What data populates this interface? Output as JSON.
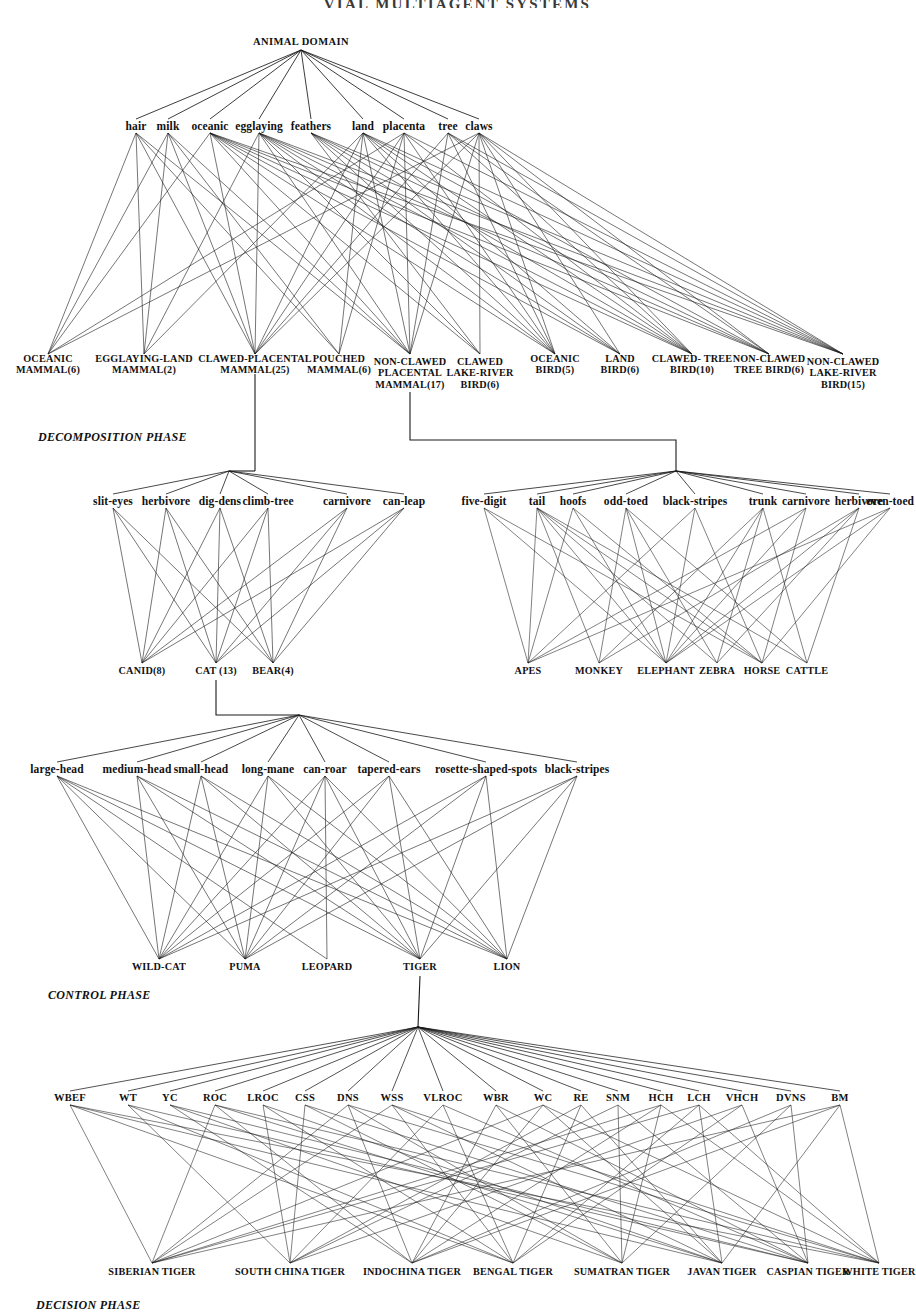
{
  "header": {
    "title": "VIAL MULTIAGENT SYSTEMS"
  },
  "phases": [
    {
      "id": "decomposition",
      "label": "DECOMPOSITION PHASE",
      "x": 38,
      "y": 430
    },
    {
      "id": "control",
      "label": "CONTROL PHASE",
      "x": 48,
      "y": 988
    },
    {
      "id": "decision",
      "label": "DECISION PHASE",
      "x": 36,
      "y": 1298
    }
  ],
  "root": {
    "label": "ANIMAL DOMAIN",
    "x": 301,
    "y": 42
  },
  "layers": {
    "domain_features": {
      "name": "domain-feature-layer",
      "y": 126,
      "items": [
        {
          "label": "hair",
          "x": 136
        },
        {
          "label": "milk",
          "x": 168
        },
        {
          "label": "oceanic",
          "x": 210
        },
        {
          "label": "egglaying",
          "x": 259
        },
        {
          "label": "feathers",
          "x": 311
        },
        {
          "label": "land",
          "x": 363
        },
        {
          "label": "placenta",
          "x": 404
        },
        {
          "label": "tree",
          "x": 448
        },
        {
          "label": "claws",
          "x": 479
        }
      ]
    },
    "decomposition_classes": {
      "name": "decomposition-class-layer",
      "y": 364,
      "items": [
        {
          "lines": [
            "OCEANIC",
            "MAMMAL(6)"
          ],
          "x": 48
        },
        {
          "lines": [
            "EGGLAYING-LAND",
            "MAMMAL(2)"
          ],
          "x": 144
        },
        {
          "lines": [
            "CLAWED-PLACENTAL",
            "MAMMAL(25)"
          ],
          "x": 255
        },
        {
          "lines": [
            "POUCHED",
            "MAMMAL(6)"
          ],
          "x": 339
        },
        {
          "lines": [
            "NON-CLAWED",
            "PLACENTAL",
            "MAMMAL(17)"
          ],
          "x": 410
        },
        {
          "lines": [
            "CLAWED",
            "LAKE-RIVER",
            "BIRD(6)"
          ],
          "x": 480
        },
        {
          "lines": [
            "OCEANIC",
            "BIRD(5)"
          ],
          "x": 555
        },
        {
          "lines": [
            "LAND",
            "BIRD(6)"
          ],
          "x": 620
        },
        {
          "lines": [
            "CLAWED- TREE",
            "BIRD(10)"
          ],
          "x": 692
        },
        {
          "lines": [
            "NON-CLAWED",
            "TREE BIRD(6)"
          ],
          "x": 769
        },
        {
          "lines": [
            "NON-CLAWED",
            "LAKE-RIVER",
            "BIRD(15)"
          ],
          "x": 843
        }
      ]
    },
    "carnivore_features": {
      "name": "clawed-placental-feature-layer",
      "y": 501,
      "items": [
        {
          "label": "slit-eyes",
          "x": 113
        },
        {
          "label": "herbivore",
          "x": 166
        },
        {
          "label": "dig-dens",
          "x": 220
        },
        {
          "label": "climb-tree",
          "x": 268
        },
        {
          "label": "carnivore",
          "x": 347
        },
        {
          "label": "can-leap",
          "x": 404
        }
      ]
    },
    "carnivore_classes": {
      "name": "clawed-placental-class-layer",
      "y": 671,
      "items": [
        {
          "label": "CANID(8)",
          "x": 142
        },
        {
          "label": "CAT  (13)",
          "x": 216
        },
        {
          "label": "BEAR(4)",
          "x": 273
        }
      ]
    },
    "ungulate_features": {
      "name": "non-clawed-placental-feature-layer",
      "y": 501,
      "items": [
        {
          "label": "five-digit",
          "x": 484
        },
        {
          "label": "tail",
          "x": 537
        },
        {
          "label": "hoofs",
          "x": 573
        },
        {
          "label": "odd-toed",
          "x": 626
        },
        {
          "label": "black-stripes",
          "x": 695
        },
        {
          "label": "trunk",
          "x": 763
        },
        {
          "label": "carnivore",
          "x": 806
        },
        {
          "label": "herbivore",
          "x": 859
        },
        {
          "label": "even-toed",
          "x": 890
        }
      ]
    },
    "ungulate_classes": {
      "name": "non-clawed-placental-class-layer",
      "y": 671,
      "items": [
        {
          "label": "APES",
          "x": 528
        },
        {
          "label": "MONKEY",
          "x": 599
        },
        {
          "label": "ELEPHANT",
          "x": 666
        },
        {
          "label": "ZEBRA",
          "x": 717
        },
        {
          "label": "HORSE",
          "x": 762
        },
        {
          "label": "CATTLE",
          "x": 807
        }
      ]
    },
    "cat_features": {
      "name": "cat-feature-layer",
      "y": 769,
      "items": [
        {
          "label": "large-head",
          "x": 57
        },
        {
          "label": "medium-head",
          "x": 137
        },
        {
          "label": "small-head",
          "x": 201
        },
        {
          "label": "long-mane",
          "x": 268
        },
        {
          "label": "can-roar",
          "x": 325
        },
        {
          "label": "tapered-ears",
          "x": 389
        },
        {
          "label": "rosette-shaped-spots",
          "x": 486
        },
        {
          "label": "black-stripes",
          "x": 577
        }
      ]
    },
    "cat_classes": {
      "name": "cat-class-layer",
      "y": 967,
      "items": [
        {
          "label": "WILD-CAT",
          "x": 159
        },
        {
          "label": "PUMA",
          "x": 245
        },
        {
          "label": "LEOPARD",
          "x": 327
        },
        {
          "label": "TIGER",
          "x": 420
        },
        {
          "label": "LION",
          "x": 507
        }
      ]
    },
    "tiger_features": {
      "name": "tiger-feature-layer",
      "y": 1098,
      "items": [
        {
          "label": "WBEF",
          "x": 70
        },
        {
          "label": "WT",
          "x": 128
        },
        {
          "label": "YC",
          "x": 170
        },
        {
          "label": "ROC",
          "x": 215
        },
        {
          "label": "LROC",
          "x": 263
        },
        {
          "label": "CSS",
          "x": 305
        },
        {
          "label": "DNS",
          "x": 348
        },
        {
          "label": "WSS",
          "x": 392
        },
        {
          "label": "VLROC",
          "x": 443
        },
        {
          "label": "WBR",
          "x": 496
        },
        {
          "label": "WC",
          "x": 543
        },
        {
          "label": "RE",
          "x": 581
        },
        {
          "label": "SNM",
          "x": 618
        },
        {
          "label": "HCH",
          "x": 661
        },
        {
          "label": "LCH",
          "x": 699
        },
        {
          "label": "VHCH",
          "x": 742
        },
        {
          "label": "DVNS",
          "x": 791
        },
        {
          "label": "BM",
          "x": 840
        }
      ]
    },
    "tiger_classes": {
      "name": "tiger-class-layer",
      "y": 1272,
      "items": [
        {
          "label": "SIBERIAN TIGER",
          "x": 152
        },
        {
          "label": "SOUTH CHINA TIGER",
          "x": 290
        },
        {
          "label": "INDOCHINA TIGER",
          "x": 412
        },
        {
          "label": "BENGAL TIGER",
          "x": 513
        },
        {
          "label": "SUMATRAN TIGER",
          "x": 622
        },
        {
          "label": "JAVAN TIGER",
          "x": 722
        },
        {
          "label": "CASPIAN TIGER",
          "x": 808
        },
        {
          "label": "WHITE TIGER",
          "x": 879
        }
      ]
    }
  },
  "hubs": {
    "carnivore_hub": {
      "x": 229,
      "y": 471,
      "name": "clawed-placental-hub"
    },
    "ungulate_hub": {
      "x": 676,
      "y": 471,
      "name": "non-clawed-placental-hub"
    },
    "cat_hub": {
      "x": 299,
      "y": 715,
      "name": "cat-hub"
    },
    "tiger_hub": {
      "x": 418,
      "y": 1027,
      "name": "tiger-hub"
    }
  },
  "style": {
    "stroke": "#1a1a1a",
    "background": "#ffffff"
  }
}
